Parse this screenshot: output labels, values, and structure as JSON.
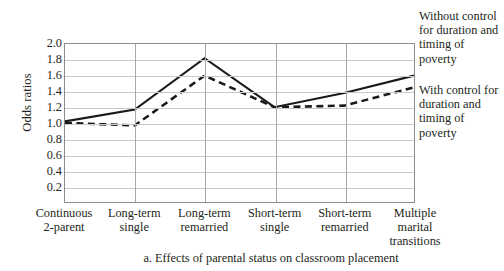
{
  "chart_data": {
    "type": "line",
    "title": "",
    "caption": "a. Effects of parental status on classroom placement",
    "xlabel": "",
    "ylabel": "Odds ratios",
    "ylim": [
      0.0,
      2.0
    ],
    "yticks": [
      "2.0",
      "1.8",
      "1.6",
      "1.4",
      "1.2",
      "1.0",
      "0.8",
      "0.6",
      "0.4",
      "0.2"
    ],
    "ytick_values": [
      2.0,
      1.8,
      1.6,
      1.4,
      1.2,
      1.0,
      0.8,
      0.6,
      0.4,
      0.2
    ],
    "grid": "horizontal and vertical",
    "legend_position": "right",
    "categories": [
      "Continuous\n2-parent",
      "Long-term\nsingle",
      "Long-term\nremarried",
      "Short-term\nsingle",
      "Short-term\nremarried",
      "Multiple\nmarital\ntransitions"
    ],
    "categories_lines": [
      [
        "Continuous",
        "2-parent"
      ],
      [
        "Long-term",
        "single"
      ],
      [
        "Long-term",
        "remarried"
      ],
      [
        "Short-term",
        "single"
      ],
      [
        "Short-term",
        "remarried"
      ],
      [
        "Multiple",
        "marital",
        "transitions"
      ]
    ],
    "series": [
      {
        "name": "Without control for duration and timing of poverty",
        "style": "solid",
        "color": "#1a1a1a",
        "values": [
          1.02,
          1.17,
          1.82,
          1.2,
          1.38,
          1.6
        ]
      },
      {
        "name": "With control for duration and timing of poverty",
        "style": "dashed",
        "color": "#1a1a1a",
        "values": [
          1.0,
          0.97,
          1.6,
          1.2,
          1.22,
          1.45
        ]
      }
    ]
  },
  "legend": {
    "without_label": "Without control for duration and timing of poverty",
    "with_label": "With control for duration and timing of poverty"
  },
  "colors": {
    "line": "#1a1a1a",
    "gridline": "#c9c9c9",
    "axis": "#8c8c8c",
    "text": "#231f20",
    "background": "#ffffff"
  }
}
